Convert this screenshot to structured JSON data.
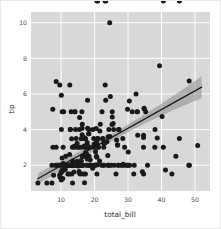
{
  "figure": {
    "background_color": "#ffffff",
    "border_color": "#e9e9e9",
    "plot_background_color": "#d8d8d8",
    "grid_color": "#ffffff"
  },
  "chart_data": {
    "type": "scatter",
    "title": "",
    "xlabel": "total_bill",
    "ylabel": "tip",
    "xlim": [
      1.0,
      54.5
    ],
    "ylim": [
      0.55,
      10.6
    ],
    "xticks": [
      10,
      20,
      30,
      40,
      50
    ],
    "xtick_labels": [
      "10",
      "20",
      "30",
      "40",
      "50"
    ],
    "yticks": [
      2,
      4,
      6,
      8,
      10
    ],
    "ytick_labels": [
      "2",
      "4",
      "6",
      "8",
      "10"
    ],
    "grid": true,
    "legend": null,
    "marker_color": "#1a1a1a",
    "marker_size": 2.5,
    "regression": {
      "show": true,
      "line_color": "#1a1a1a",
      "band_color": "#8c8c8c",
      "band_opacity": 0.55,
      "slope": 0.105,
      "intercept": 0.92,
      "x_start": 3.0,
      "x_end": 52.0,
      "ci_halfwidth_start": 0.3,
      "ci_halfwidth_end": 0.62
    },
    "x": [
      16.99,
      10.34,
      21.01,
      23.68,
      24.59,
      25.29,
      8.77,
      26.88,
      15.04,
      14.78,
      10.27,
      35.26,
      15.42,
      18.43,
      14.83,
      21.58,
      10.33,
      16.29,
      16.97,
      20.65,
      17.92,
      20.29,
      15.77,
      39.42,
      19.82,
      17.81,
      13.37,
      12.69,
      21.7,
      19.65,
      9.55,
      18.35,
      15.06,
      20.69,
      17.78,
      24.06,
      16.31,
      16.93,
      18.69,
      31.27,
      16.04,
      17.46,
      13.94,
      9.68,
      30.4,
      18.29,
      22.23,
      32.4,
      28.55,
      18.04,
      12.54,
      10.29,
      34.81,
      9.94,
      25.56,
      19.49,
      38.01,
      26.41,
      11.24,
      48.27,
      20.29,
      13.81,
      11.02,
      18.29,
      17.59,
      20.08,
      16.45,
      3.07,
      20.23,
      15.01,
      12.02,
      17.07,
      26.86,
      25.28,
      14.73,
      10.51,
      17.92,
      27.2,
      22.76,
      17.29,
      19.44,
      16.66,
      10.07,
      32.68,
      15.98,
      34.83,
      13.03,
      18.28,
      24.71,
      21.16,
      28.97,
      22.49,
      5.75,
      16.32,
      22.75,
      40.17,
      27.28,
      12.03,
      21.01,
      12.46,
      11.35,
      15.38,
      44.3,
      22.42,
      20.92,
      15.36,
      20.49,
      25.21,
      18.24,
      14.31,
      14.0,
      7.25,
      38.07,
      23.95,
      25.71,
      17.31,
      29.85,
      14.48,
      9.6,
      34.63,
      34.65,
      23.33,
      45.35,
      23.17,
      40.55,
      20.69,
      20.9,
      30.46,
      18.15,
      23.1,
      15.69,
      19.81,
      28.44,
      15.48,
      16.58,
      7.56,
      10.34,
      43.11,
      13.0,
      13.51,
      18.71,
      12.74,
      13.0,
      16.4,
      20.53,
      16.47,
      26.59,
      38.73,
      24.27,
      12.76,
      30.06,
      25.89,
      48.33,
      13.27,
      28.17,
      12.9,
      28.15,
      11.59,
      7.74,
      30.14,
      12.16,
      13.42,
      8.58,
      15.98,
      13.42,
      16.27,
      10.09,
      20.45,
      13.28,
      22.12,
      24.01,
      15.69,
      11.61,
      10.77,
      15.53,
      10.07,
      12.6,
      32.83,
      35.83,
      29.03,
      27.18,
      22.67,
      17.82,
      18.78,
      10.65,
      12.43,
      24.08,
      11.69,
      13.42,
      14.26,
      15.95,
      12.48,
      29.8,
      8.52,
      14.52,
      11.38,
      22.82,
      19.08,
      20.27,
      11.17,
      12.26,
      18.26,
      8.51,
      10.33,
      14.15,
      16.0,
      13.16,
      17.47,
      34.3,
      41.19,
      27.05,
      16.43,
      8.35,
      18.64,
      11.87,
      9.78,
      7.51,
      14.07,
      13.13,
      17.26,
      24.55,
      19.77,
      29.85,
      48.17,
      25.0,
      13.39,
      16.49,
      21.5,
      12.66,
      16.21,
      13.81,
      17.51,
      24.52,
      20.76,
      31.71,
      10.59,
      10.63,
      50.81,
      15.81,
      7.25,
      31.85,
      16.82,
      32.9,
      17.89,
      14.48,
      9.6,
      34.63,
      34.65,
      23.33,
      45.35,
      23.17,
      40.55,
      20.69,
      20.9
    ],
    "y": [
      1.01,
      1.66,
      3.5,
      3.31,
      3.61,
      4.71,
      2.0,
      3.12,
      1.96,
      3.23,
      1.71,
      5.0,
      1.57,
      3.0,
      3.02,
      3.92,
      1.67,
      3.71,
      3.5,
      3.35,
      4.08,
      2.75,
      2.23,
      7.58,
      3.18,
      2.34,
      2.0,
      2.0,
      4.3,
      3.0,
      1.45,
      2.5,
      3.0,
      2.45,
      3.27,
      3.6,
      2.0,
      3.07,
      2.31,
      5.0,
      2.24,
      2.54,
      3.06,
      1.32,
      5.6,
      3.0,
      5.0,
      6.0,
      2.05,
      3.0,
      2.6,
      2.4,
      5.2,
      1.56,
      4.34,
      4.0,
      3.0,
      1.5,
      1.76,
      6.73,
      3.21,
      2.0,
      1.98,
      3.76,
      2.64,
      3.15,
      2.47,
      1.0,
      2.01,
      2.09,
      1.97,
      3.0,
      3.14,
      5.0,
      2.2,
      1.25,
      3.08,
      4.0,
      3.0,
      2.71,
      1.83,
      3.5,
      1.17,
      5.0,
      2.0,
      5.17,
      2.0,
      4.0,
      5.85,
      3.0,
      3.0,
      3.5,
      1.0,
      4.3,
      3.25,
      4.73,
      4.0,
      1.5,
      3.0,
      1.5,
      2.5,
      3.0,
      2.5,
      3.48,
      2.03,
      1.64,
      4.06,
      4.29,
      3.76,
      4.0,
      3.0,
      1.0,
      4.0,
      2.55,
      4.0,
      3.5,
      5.14,
      2.0,
      2.0,
      3.55,
      3.68,
      5.65,
      3.5,
      6.5,
      3.0,
      1.5,
      3.5,
      2.0,
      3.0,
      3.25,
      1.5,
      2.0,
      3.5,
      4.0,
      1.5,
      3.0,
      2.0,
      1.5,
      5.0,
      2.0,
      2.0,
      4.0,
      2.0,
      2.0,
      2.5,
      2.5,
      3.41,
      3.52,
      4.0,
      4.0,
      2.74,
      2.0,
      2.0,
      2.0,
      2.0,
      2.0,
      2.0,
      2.0,
      1.44,
      2.0,
      2.0,
      1.0,
      2.0,
      3.48,
      2.24,
      4.08,
      4.0,
      3.0,
      2.0,
      2.0,
      2.0,
      2.0,
      2.0,
      5.0,
      4.67,
      5.92,
      6.5,
      5.0,
      2.0,
      2.0,
      2.0,
      2.0,
      2.0,
      2.0,
      2.0,
      2.0,
      2.0,
      2.0,
      2.0,
      2.0,
      3.0,
      2.0,
      2.0,
      3.0,
      2.0,
      2.0,
      2.0,
      2.0,
      2.0,
      2.0,
      2.0,
      2.0,
      6.7,
      5.0,
      5.0,
      2.0,
      1.5,
      3.0,
      1.63,
      1.73,
      2.0,
      2.5,
      2.0,
      2.0,
      2.0,
      2.0,
      5.14,
      5.0,
      3.48,
      1.5,
      2.0,
      3.5,
      2.0,
      2.0,
      2.0,
      3.0,
      2.0,
      2.24,
      2.0,
      5.0,
      1.61,
      2.0,
      10.0,
      3.16,
      1.5,
      3.0,
      2.09,
      3.11,
      2.0,
      2.0,
      2.0,
      3.55,
      3.68,
      5.65,
      3.5,
      6.5,
      3.0,
      1.5
    ]
  }
}
